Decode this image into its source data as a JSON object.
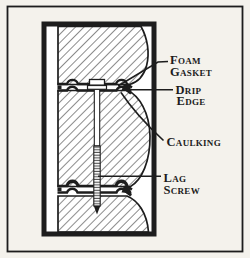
{
  "figure": {
    "labels": {
      "foam_gasket": {
        "line1": "Foam",
        "line2": "Gasket"
      },
      "drip_edge": {
        "line1": "Drip",
        "line2": "Edge"
      },
      "caulking": {
        "line1": "Caulking"
      },
      "lag_screw": {
        "line1": "Lag",
        "line2": "Screw"
      }
    },
    "colors": {
      "ink": "#1d1d1d",
      "paper": "#f4f2ec"
    }
  }
}
